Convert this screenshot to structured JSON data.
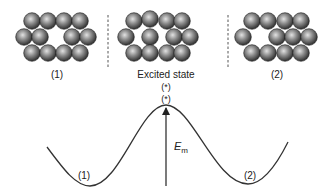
{
  "diagram": {
    "clusters": [
      {
        "id": "state-1",
        "label": "(1)",
        "label_pos": [
          57,
          78
        ],
        "spheres": [
          [
            32,
            21
          ],
          [
            48,
            21
          ],
          [
            64,
            21
          ],
          [
            80,
            21
          ],
          [
            24,
            37
          ],
          [
            40,
            37
          ],
          [
            72,
            37
          ],
          [
            88,
            37
          ],
          [
            32,
            53
          ],
          [
            48,
            53
          ],
          [
            64,
            53
          ],
          [
            80,
            53
          ]
        ]
      },
      {
        "id": "excited",
        "label": "Excited state",
        "label_pos": [
          166,
          78
        ],
        "spheres": [
          [
            134,
            21
          ],
          [
            150,
            19
          ],
          [
            167,
            21
          ],
          [
            182,
            21
          ],
          [
            126,
            37
          ],
          [
            150,
            37
          ],
          [
            174,
            37
          ],
          [
            190,
            37
          ],
          [
            134,
            53
          ],
          [
            150,
            53
          ],
          [
            167,
            53
          ],
          [
            182,
            53
          ]
        ]
      },
      {
        "id": "state-2",
        "label": "(2)",
        "label_pos": [
          277,
          78
        ],
        "spheres": [
          [
            252,
            21
          ],
          [
            268,
            21
          ],
          [
            285,
            21
          ],
          [
            301,
            21
          ],
          [
            243,
            37
          ],
          [
            277,
            37
          ],
          [
            293,
            37
          ],
          [
            309,
            37
          ],
          [
            252,
            53
          ],
          [
            268,
            53
          ],
          [
            285,
            53
          ],
          [
            301,
            53
          ]
        ]
      }
    ],
    "separators": [
      {
        "x": 108,
        "y1": 15,
        "y2": 68
      },
      {
        "x": 228,
        "y1": 15,
        "y2": 68
      }
    ],
    "excited_marks": [
      {
        "text": "(*)",
        "pos": [
          166,
          90
        ]
      },
      {
        "text": "(*)",
        "pos": [
          166,
          102
        ]
      }
    ],
    "energy_curve": {
      "path": "M47,147 C64,170 76,186 90,186 C120,186 140,105 166,105 C192,105 215,184 248,184 C262,184 276,166 288,142",
      "minimum_labels": [
        {
          "text": "(1)",
          "pos": [
            84,
            179
          ]
        },
        {
          "text": "(2)",
          "pos": [
            250,
            179
          ]
        }
      ]
    },
    "barrier_arrow": {
      "x": 166,
      "y_bottom": 186,
      "y_top": 107,
      "label_main": "E",
      "label_sub": "m",
      "label_pos": [
        174,
        150
      ]
    },
    "colors": {
      "line": "#333333",
      "dash": "#555555",
      "sphere_light": "#d8d8d8",
      "sphere_mid": "#8a8a8a",
      "sphere_dark": "#2a2a2a"
    }
  }
}
